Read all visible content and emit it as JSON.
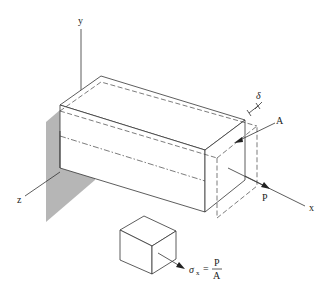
{
  "figure": {
    "axes": {
      "x_label": "x",
      "y_label": "y",
      "z_label": "z"
    },
    "labels": {
      "delta": "δ",
      "area": "A",
      "load": "P"
    },
    "stress_element": {
      "sigma": "σ",
      "subscript": "x",
      "equals": "=",
      "numerator": "P",
      "denominator": "A"
    },
    "colors": {
      "wall": "#a9a9a9",
      "line": "#333333",
      "background": "#ffffff"
    }
  }
}
